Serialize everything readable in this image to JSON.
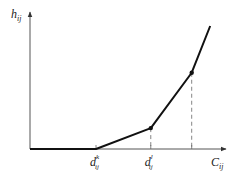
{
  "chart_data": {
    "type": "line",
    "title": "",
    "xlabel": {
      "base": "C",
      "sub": "ij"
    },
    "ylabel": {
      "base": "h",
      "sub": "ij"
    },
    "x_ticks": [
      {
        "base": "d",
        "sub": "ij",
        "sup": "k",
        "x": 1.0
      },
      {
        "base": "d",
        "sub": "ij",
        "sup": "l",
        "x": 1.83
      },
      {
        "base": "",
        "sub": "",
        "sup": "",
        "x": 2.45
      }
    ],
    "series": [
      {
        "name": "piecewise-linear-cost",
        "points": [
          {
            "x": 0.0,
            "y": 0.0
          },
          {
            "x": 1.0,
            "y": 0.0
          },
          {
            "x": 1.83,
            "y": 0.17
          },
          {
            "x": 2.45,
            "y": 0.62
          },
          {
            "x": 2.73,
            "y": 1.0
          }
        ],
        "markers_at": [
          2,
          3
        ]
      }
    ],
    "dashed_guides_at": [
      1.0,
      1.83,
      2.45
    ],
    "xlim": [
      0,
      2.95
    ],
    "ylim": [
      0,
      1.1
    ],
    "grid": false,
    "legend": "none"
  }
}
